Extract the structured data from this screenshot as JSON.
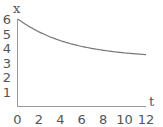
{
  "chart_data": {
    "type": "line",
    "title": "",
    "xlabel": "t",
    "ylabel": "x",
    "xlim": [
      0,
      12
    ],
    "ylim": [
      0,
      6
    ],
    "xticks": [
      "0",
      "2",
      "4",
      "6",
      "8",
      "10",
      "12"
    ],
    "yticks": [
      "1",
      "2",
      "3",
      "4",
      "5",
      "6"
    ],
    "grid": false,
    "legend": "none",
    "series": [
      {
        "name": "x(t)",
        "x": [
          0,
          1,
          2,
          3,
          4,
          5,
          6,
          7,
          8,
          9,
          10,
          11,
          12
        ],
        "y": [
          6.0,
          5.51,
          5.11,
          4.78,
          4.51,
          4.29,
          4.11,
          3.97,
          3.85,
          3.75,
          3.67,
          3.61,
          3.55
        ]
      }
    ],
    "colors": {
      "curve": "#777777",
      "axis": "#999999",
      "text": "#555555"
    }
  }
}
